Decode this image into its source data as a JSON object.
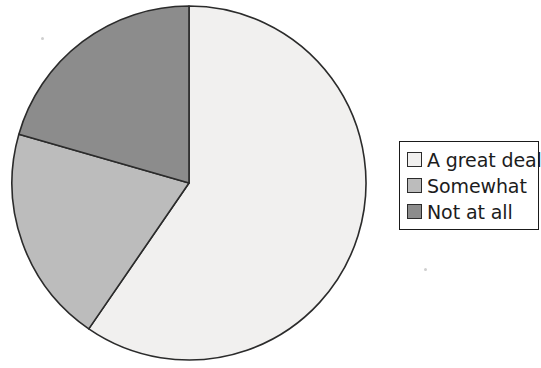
{
  "chart_data": {
    "type": "pie",
    "title": "",
    "categories": [
      "A great deal",
      "Somewhat",
      "Not at all"
    ],
    "values": [
      59.6,
      19.9,
      20.5
    ],
    "units": "percent",
    "start_angle_deg": 0,
    "direction": "clockwise",
    "slice_colors": [
      "#f1f0ef",
      "#bcbcbc",
      "#8c8c8c"
    ],
    "edge_color": "#2b2b2b",
    "legend": {
      "position": "right",
      "entries": [
        {
          "label": "A great deal",
          "color": "#f1f0ef"
        },
        {
          "label": "Somewhat",
          "color": "#bcbcbc"
        },
        {
          "label": "Not at all",
          "color": "#8c8c8c"
        }
      ]
    },
    "grid": false,
    "xlabel": "",
    "ylabel": ""
  },
  "pie": {
    "center_x": 189,
    "center_y": 183,
    "radius": 177,
    "slices": [
      {
        "name": "a-great-deal",
        "start_deg": 0,
        "end_deg": 214.5,
        "color": "#f1f0ef"
      },
      {
        "name": "somewhat",
        "start_deg": 214.5,
        "end_deg": 286.0,
        "color": "#bcbcbc"
      },
      {
        "name": "not-at-all",
        "start_deg": 286.0,
        "end_deg": 360,
        "color": "#8c8c8c"
      }
    ]
  }
}
